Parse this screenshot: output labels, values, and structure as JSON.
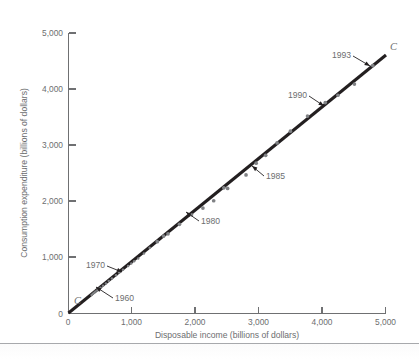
{
  "figure": {
    "background_color": "#ffffff",
    "line_color": "#231f20",
    "point_color": "#808285",
    "axis_color": "#6f7072",
    "text_color": "#6d6e70",
    "rule_color": "#a7a9ac"
  },
  "chart_data": {
    "type": "scatter",
    "title": "",
    "subtitle": "",
    "xlabel": "Disposable income (billions of dollars)",
    "ylabel": "Consumption expenditure (billions of dollars)",
    "xlim": [
      0,
      5000
    ],
    "ylim": [
      0,
      5000
    ],
    "xticks": [
      0,
      1000,
      2000,
      3000,
      4000,
      5000
    ],
    "yticks": [
      0,
      1000,
      2000,
      3000,
      4000,
      5000
    ],
    "xtick_labels": [
      "0",
      "1,000",
      "2,000",
      "3,000",
      "4,000",
      "5,000"
    ],
    "ytick_labels": [
      "0",
      "1,000",
      "2,000",
      "3,000",
      "4,000",
      "5,000"
    ],
    "grid": false,
    "legend": false,
    "series": [
      {
        "name": "C",
        "kind": "scatter",
        "x": [
          365,
          385,
          405,
          425,
          455,
          480,
          505,
          545,
          590,
          635,
          685,
          750,
          800,
          860,
          940,
          990,
          1035,
          1100,
          1190,
          1280,
          1400,
          1500,
          1570,
          1750,
          1940,
          2120,
          2290,
          2450,
          2510,
          2800,
          2960,
          3110,
          3290,
          3500,
          3770,
          4050,
          4250,
          4510,
          4800
        ],
        "y": [
          330,
          350,
          370,
          390,
          415,
          440,
          460,
          495,
          535,
          580,
          625,
          680,
          730,
          780,
          845,
          890,
          930,
          980,
          1070,
          1170,
          1280,
          1380,
          1420,
          1590,
          1760,
          1880,
          2010,
          2240,
          2230,
          2470,
          2680,
          2820,
          3040,
          3250,
          3520,
          3760,
          3890,
          4090,
          4420
        ]
      },
      {
        "name": "C",
        "kind": "line",
        "x": [
          0,
          5000
        ],
        "y": [
          0,
          4600
        ],
        "label": "C"
      }
    ],
    "annotations": [
      {
        "text": "1960",
        "target_x": 365,
        "target_y": 330
      },
      {
        "text": "1970",
        "target_x": 750,
        "target_y": 680
      },
      {
        "text": "1980",
        "target_x": 1940,
        "target_y": 1760
      },
      {
        "text": "1985",
        "target_x": 2960,
        "target_y": 2680
      },
      {
        "text": "1990",
        "target_x": 4050,
        "target_y": 3760
      },
      {
        "text": "1993",
        "target_x": 4800,
        "target_y": 4420
      }
    ],
    "line_endpoint_labels": [
      {
        "text": "C",
        "position": "origin"
      },
      {
        "text": "C",
        "position": "upper-right"
      }
    ]
  },
  "axes": {
    "x_title": "Disposable income (billions of dollars)",
    "y_title": "Consumption expenditure (billions of dollars)",
    "x_labels": [
      "0",
      "1,000",
      "2,000",
      "3,000",
      "4,000",
      "5,000"
    ],
    "y_labels": [
      "0",
      "1,000",
      "2,000",
      "3,000",
      "4,000",
      "5,000"
    ]
  },
  "annotations": {
    "a1": "1960",
    "a2": "1970",
    "a3": "1980",
    "a4": "1985",
    "a5": "1990",
    "a6": "1993",
    "curve_origin": "C",
    "curve_end": "C"
  }
}
